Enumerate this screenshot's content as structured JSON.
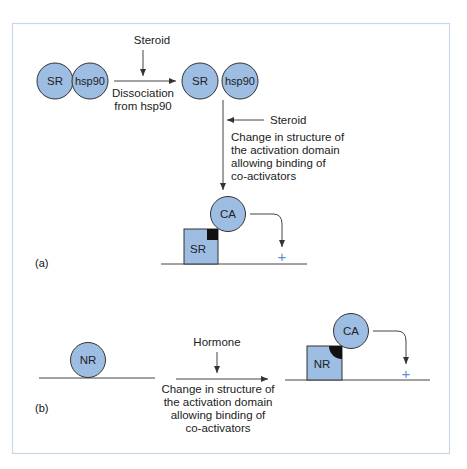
{
  "panel_a": {
    "label": "(a)",
    "complex": {
      "receptor": "SR",
      "chaperone": "hsp90"
    },
    "step1": {
      "input": "Steroid",
      "caption_line1": "Dissociation",
      "caption_line2": "from hsp90"
    },
    "free": {
      "receptor": "SR",
      "chaperone": "hsp90"
    },
    "step2": {
      "input": "Steroid",
      "caption": [
        "Change in structure of",
        "the activation domain",
        "allowing binding of",
        "co-activators"
      ]
    },
    "bound": {
      "coactivator": "CA",
      "receptor": "SR",
      "effect": "+"
    }
  },
  "panel_b": {
    "label": "(b)",
    "unbound": {
      "receptor": "NR"
    },
    "step": {
      "input": "Hormone",
      "caption": [
        "Change in structure of",
        "the activation domain",
        "allowing binding of",
        "co-activators"
      ]
    },
    "bound": {
      "coactivator": "CA",
      "receptor": "NR",
      "effect": "+"
    }
  },
  "colors": {
    "protein_fill": "#9dbde3",
    "frame": "#c8d8e8",
    "plus": "#5a8fd0",
    "line": "#444444"
  }
}
